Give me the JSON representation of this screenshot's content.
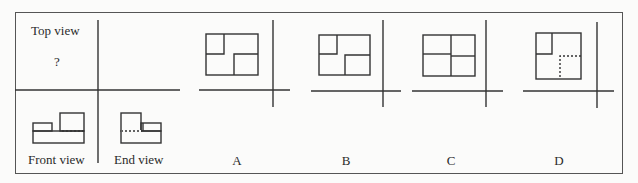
{
  "figure": {
    "labels": {
      "top_view": "Top view",
      "unknown_marker": "?",
      "front_view": "Front view",
      "end_view": "End view"
    },
    "options": [
      {
        "letter": "A",
        "description": "Rectangle; top-left inner square; bottom-right inner square, both solid lines"
      },
      {
        "letter": "B",
        "description": "Rectangle; smaller top-left inner square; bottom-right inner square, both solid lines"
      },
      {
        "letter": "C",
        "description": "Rectangle divided into four quadrants by solid lines"
      },
      {
        "letter": "D",
        "description": "Square; top-left inner square solid; bottom-right region outlined with dashed (hidden) lines"
      }
    ],
    "colors": {
      "line": "#333333",
      "background": "#fbfbfa",
      "border": "#555555"
    }
  }
}
